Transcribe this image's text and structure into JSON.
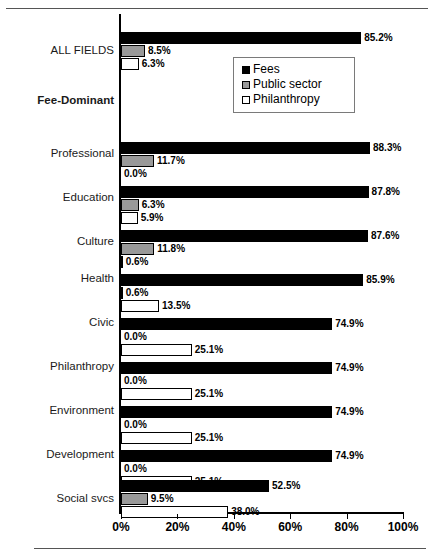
{
  "chart_data": {
    "type": "bar",
    "orientation": "horizontal",
    "title": "",
    "xlabel": "",
    "ylabel": "",
    "xlim": [
      0,
      100
    ],
    "xticks": [
      "0%",
      "20%",
      "40%",
      "60%",
      "80%",
      "100%"
    ],
    "xtick_values": [
      0,
      20,
      40,
      60,
      80,
      100
    ],
    "grid": false,
    "legend_position": "top-right",
    "series": [
      {
        "name": "Fees",
        "color": "#000000",
        "key": "fees"
      },
      {
        "name": "Public sector",
        "color": "#999999",
        "key": "public"
      },
      {
        "name": "Philanthropy",
        "color": "#ffffff",
        "key": "phil"
      }
    ],
    "categories": [
      "ALL FIELDS",
      "Fee-Dominant",
      "Professional",
      "Education",
      "Culture",
      "Health",
      "Civic",
      "Philanthropy",
      "Environment",
      "Development",
      "Social svcs"
    ],
    "groups": [
      {
        "label": "ALL FIELDS",
        "header": false,
        "values": [
          85.2,
          8.5,
          6.3
        ],
        "labels": [
          "85.2%",
          "8.5%",
          "6.3%"
        ]
      },
      {
        "label": "Fee-Dominant",
        "header": true,
        "values": [],
        "labels": []
      },
      {
        "label": "Professional",
        "header": false,
        "values": [
          88.3,
          11.7,
          0.0
        ],
        "labels": [
          "88.3%",
          "11.7%",
          "0.0%"
        ]
      },
      {
        "label": "Education",
        "header": false,
        "values": [
          87.8,
          6.3,
          5.9
        ],
        "labels": [
          "87.8%",
          "6.3%",
          "5.9%"
        ]
      },
      {
        "label": "Culture",
        "header": false,
        "values": [
          87.6,
          11.8,
          0.6
        ],
        "labels": [
          "87.6%",
          "11.8%",
          "0.6%"
        ]
      },
      {
        "label": "Health",
        "header": false,
        "values": [
          85.9,
          0.6,
          13.5
        ],
        "labels": [
          "85.9%",
          "0.6%",
          "13.5%"
        ]
      },
      {
        "label": "Civic",
        "header": false,
        "values": [
          74.9,
          0.0,
          25.1
        ],
        "labels": [
          "74.9%",
          "0.0%",
          "25.1%"
        ]
      },
      {
        "label": "Philanthropy",
        "header": false,
        "values": [
          74.9,
          0.0,
          25.1
        ],
        "labels": [
          "74.9%",
          "0.0%",
          "25.1%"
        ]
      },
      {
        "label": "Environment",
        "header": false,
        "values": [
          74.9,
          0.0,
          25.1
        ],
        "labels": [
          "74.9%",
          "0.0%",
          "25.1%"
        ]
      },
      {
        "label": "Development",
        "header": false,
        "values": [
          74.9,
          0.0,
          25.1
        ],
        "labels": [
          "74.9%",
          "0.0%",
          "25.1%"
        ]
      },
      {
        "label": "Social svcs",
        "header": false,
        "values": [
          52.5,
          9.5,
          38.0
        ],
        "labels": [
          "52.5%",
          "9.5%",
          "38.0%"
        ]
      }
    ]
  },
  "legend": {
    "items": [
      {
        "label": "Fees",
        "swatch": "s-fees"
      },
      {
        "label": "Public sector",
        "swatch": "s-public"
      },
      {
        "label": "Philanthropy",
        "swatch": "s-phil"
      }
    ]
  },
  "footnote": {
    "text": ""
  }
}
